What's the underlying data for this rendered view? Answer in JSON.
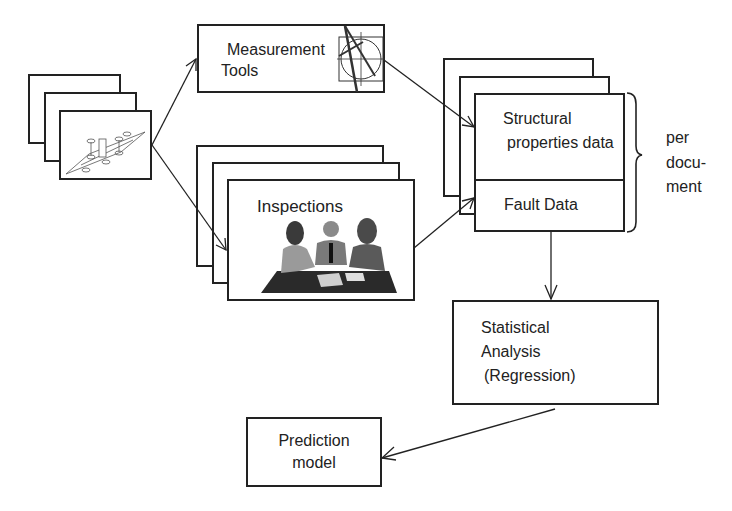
{
  "diagram": {
    "nodes": {
      "documents": {
        "label": "",
        "icon": "circuit-diagram-icon"
      },
      "measurement_tools": {
        "line1": "Measurement",
        "line2": "Tools",
        "icon": "compass-drafting-icon"
      },
      "inspections": {
        "label": "Inspections",
        "icon": "meeting-people-icon"
      },
      "structural_data": {
        "line1": "Structural",
        "line2": "properties data"
      },
      "fault_data": {
        "label": "Fault Data"
      },
      "per_document": {
        "line1": "per",
        "line2": "docu-",
        "line3": "ment"
      },
      "statistical_analysis": {
        "line1": "Statistical",
        "line2": "Analysis",
        "line3": "(Regression)"
      },
      "prediction_model": {
        "line1": "Prediction",
        "line2": "model"
      }
    },
    "edges": [
      {
        "from": "documents",
        "to": "measurement_tools"
      },
      {
        "from": "documents",
        "to": "inspections"
      },
      {
        "from": "measurement_tools",
        "to": "structural_data"
      },
      {
        "from": "inspections",
        "to": "fault_data"
      },
      {
        "from": "fault_data",
        "to": "statistical_analysis"
      },
      {
        "from": "statistical_analysis",
        "to": "prediction_model"
      }
    ]
  }
}
